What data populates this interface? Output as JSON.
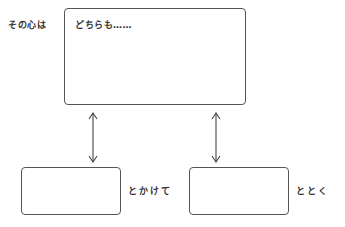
{
  "top": {
    "side_label": "その心は",
    "box_text": "どちらも……"
  },
  "bottom_left": {
    "side_label": "とかけて",
    "box_text": ""
  },
  "bottom_right": {
    "side_label": "ととく",
    "box_text": ""
  }
}
